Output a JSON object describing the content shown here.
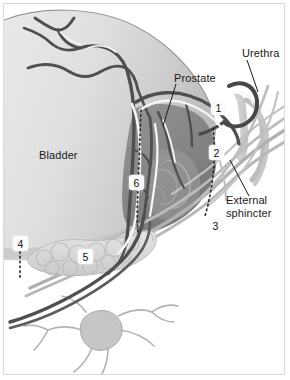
{
  "figure": {
    "kind": "anatomical-diagram",
    "width": 290,
    "height": 380,
    "background_color": "#ffffff",
    "frame_color": "#d9d9d9"
  },
  "labels": {
    "bladder": "Bladder",
    "prostate": "Prostate",
    "urethra": "Urethra",
    "external_sphincter_line1": "External",
    "external_sphincter_line2": "sphincter"
  },
  "numbered_markers": [
    {
      "id": "marker-1",
      "value": "1"
    },
    {
      "id": "marker-2",
      "value": "2"
    },
    {
      "id": "marker-3",
      "value": "3"
    },
    {
      "id": "marker-4",
      "value": "4"
    },
    {
      "id": "marker-5",
      "value": "5"
    },
    {
      "id": "marker-6",
      "value": "6"
    }
  ],
  "colors": {
    "bladder_fill_light": "#e4e4e4",
    "bladder_fill_mid": "#d2d2d2",
    "bladder_fill_dark": "#bdbdbd",
    "prostate_fill": "#8e8e8e",
    "prostate_fill_dark": "#7a7a7a",
    "seminal_vesicle_fill": "#dcdcdc",
    "vessel_dark": "#4a4a4a",
    "vessel_mid": "#6d6d6d",
    "vessel_light": "#ffffff",
    "nerve_gray": "#a8a8a8",
    "urethra_fill": "#cfcfcf",
    "dotted_line": "#2b2b2b",
    "leader_line": "#1a1a1a",
    "text": "#1a1a1a"
  }
}
